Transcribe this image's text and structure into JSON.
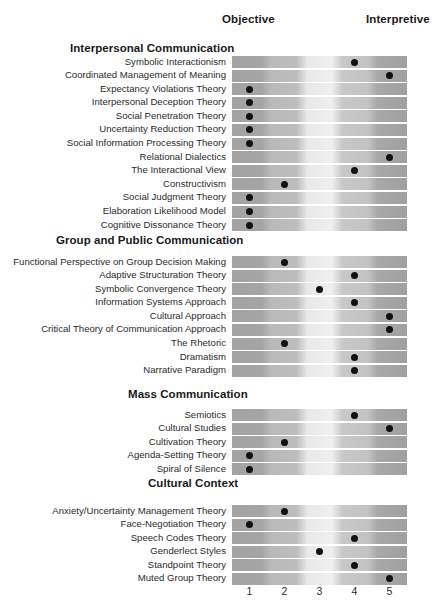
{
  "axis": {
    "left_label": "Objective",
    "right_label": "Interpretive",
    "ticks": [
      "1",
      "2",
      "3",
      "4",
      "5"
    ]
  },
  "chart_data": {
    "type": "scatter",
    "title": "",
    "xlabel": "",
    "ylabel": "",
    "xlim": [
      1,
      5
    ],
    "grid": false,
    "legend": null,
    "x_tick_labels": [
      "1",
      "2",
      "3",
      "4",
      "5"
    ],
    "axis_endpoint_labels": {
      "left": "Objective",
      "right": "Interpretive"
    },
    "scale_note": "1 = most objective, 5 = most interpretive",
    "sections": [
      {
        "name": "Interpersonal Communication",
        "rows": [
          {
            "label": "Symbolic Interactionism",
            "value": 4
          },
          {
            "label": "Coordinated Management of Meaning",
            "value": 5
          },
          {
            "label": "Expectancy Violations Theory",
            "value": 1
          },
          {
            "label": "Interpersonal Deception Theory",
            "value": 1
          },
          {
            "label": "Social Penetration Theory",
            "value": 1
          },
          {
            "label": "Uncertainty Reduction Theory",
            "value": 1
          },
          {
            "label": "Social Information Processing Theory",
            "value": 1
          },
          {
            "label": "Relational Dialectics",
            "value": 5
          },
          {
            "label": "The Interactional View",
            "value": 4
          },
          {
            "label": "Constructivism",
            "value": 2
          },
          {
            "label": "Social Judgment Theory",
            "value": 1
          },
          {
            "label": "Elaboration Likelihood Model",
            "value": 1
          },
          {
            "label": "Cognitive Dissonance Theory",
            "value": 1
          }
        ]
      },
      {
        "name": "Group and Public Communication",
        "rows": [
          {
            "label": "Functional Perspective on Group Decision Making",
            "value": 2
          },
          {
            "label": "Adaptive Structuration Theory",
            "value": 4
          },
          {
            "label": "Symbolic Convergence Theory",
            "value": 3
          },
          {
            "label": "Information Systems Approach",
            "value": 4
          },
          {
            "label": "Cultural Approach",
            "value": 5
          },
          {
            "label": "Critical Theory of Communication Approach",
            "value": 5
          },
          {
            "label": "The Rhetoric",
            "value": 2
          },
          {
            "label": "Dramatism",
            "value": 4
          },
          {
            "label": "Narrative Paradigm",
            "value": 4
          }
        ]
      },
      {
        "name": "Mass Communication",
        "rows": [
          {
            "label": "Semiotics",
            "value": 4
          },
          {
            "label": "Cultural Studies",
            "value": 5
          },
          {
            "label": "Cultivation Theory",
            "value": 2
          },
          {
            "label": "Agenda-Setting Theory",
            "value": 1
          },
          {
            "label": "Spiral of Silence",
            "value": 1
          }
        ]
      },
      {
        "name": "Cultural Context",
        "rows": [
          {
            "label": "Anxiety/Uncertainty Management Theory",
            "value": 2
          },
          {
            "label": "Face-Negotiation Theory",
            "value": 1
          },
          {
            "label": "Speech Codes Theory",
            "value": 4
          },
          {
            "label": "Genderlect Styles",
            "value": 3
          },
          {
            "label": "Standpoint Theory",
            "value": 4
          },
          {
            "label": "Muted Group Theory",
            "value": 5
          }
        ]
      }
    ]
  },
  "style": {
    "dot_color": "#111111",
    "text_color": "#231f20",
    "bar_dark": "#a3a3a3",
    "bar_light": "#efefef",
    "background": "#ffffff"
  }
}
